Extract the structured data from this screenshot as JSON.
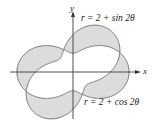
{
  "diagram": {
    "type": "polar-curves-symmetric-difference",
    "axes": {
      "x_label": "x",
      "y_label": "y"
    },
    "curves": [
      {
        "name": "sin-curve",
        "equation_label": "r = 2 + sin 2θ",
        "a": 2,
        "b": 1,
        "func": "sin",
        "k": 2
      },
      {
        "name": "cos-curve",
        "equation_label": "r = 2 + cos 2θ",
        "a": 2,
        "b": 1,
        "func": "cos",
        "k": 2
      }
    ],
    "shading": "regions inside exactly one of the two curves",
    "colors": {
      "shade": "#dcdcdc",
      "curve": "#6a6a6a",
      "axis": "#3a3a3a"
    }
  }
}
